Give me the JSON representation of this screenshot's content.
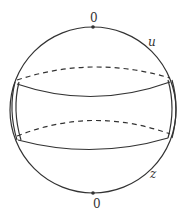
{
  "diagram": {
    "type": "sphere-with-bands",
    "labels": {
      "top": "0",
      "bottom": "0",
      "upper_right": "u",
      "lower_right": "z"
    },
    "colors": {
      "stroke": "#333333",
      "background": "#ffffff"
    }
  }
}
